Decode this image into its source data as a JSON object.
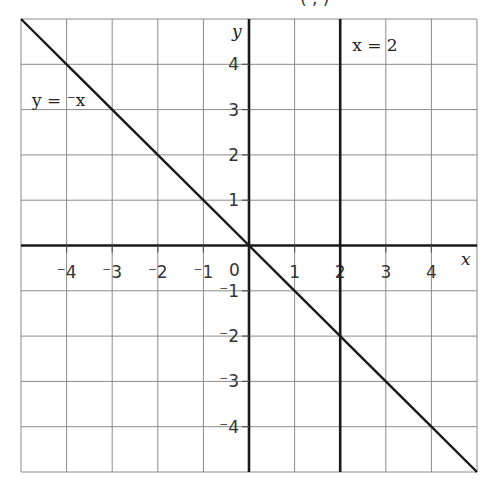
{
  "header": {
    "cut_off_title_fragment": "(  ,  )"
  },
  "chart_data": {
    "type": "line",
    "title": "",
    "xlabel": "x",
    "ylabel": "y",
    "xlim": [
      -5,
      5
    ],
    "ylim": [
      -5,
      5
    ],
    "grid": true,
    "x_ticks": [
      -4,
      -3,
      -2,
      -1,
      0,
      1,
      2,
      3,
      4
    ],
    "y_ticks": [
      -4,
      -3,
      -2,
      -1,
      1,
      2,
      3,
      4
    ],
    "x_tick_labels": [
      "⁻4",
      "⁻3",
      "⁻2",
      "⁻1",
      "0",
      "1",
      "2",
      "3",
      "4"
    ],
    "y_tick_labels": [
      "⁻4",
      "⁻3",
      "⁻2",
      "⁻1",
      "1",
      "2",
      "3",
      "4"
    ],
    "origin_label": "0",
    "series": [
      {
        "name": "y = ⁻x",
        "label": "y = ⁻x",
        "kind": "line",
        "x": [
          -5,
          -4,
          -3,
          -2,
          -1,
          0,
          1,
          2,
          3,
          4,
          5
        ],
        "y": [
          5,
          4,
          3,
          2,
          1,
          0,
          -1,
          -2,
          -3,
          -4,
          -5
        ]
      },
      {
        "name": "x = 2",
        "label": "x = 2",
        "kind": "vertical",
        "x": [
          2,
          2
        ],
        "y": [
          -5,
          5
        ]
      }
    ],
    "annotations": [
      {
        "text": "y = ⁻x",
        "x": -4.9,
        "y": 2.6
      },
      {
        "text": "x = 2",
        "x": 2.25,
        "y": 4.3
      }
    ]
  },
  "labels": {
    "x_axis": "x",
    "y_axis": "y",
    "line1": "y = ⁻x",
    "line2": "x = 2",
    "origin": "0"
  },
  "colors": {
    "grid": "#8a8a8a",
    "axis": "#1a1a1a",
    "line": "#1a1a1a",
    "text": "#333333"
  }
}
